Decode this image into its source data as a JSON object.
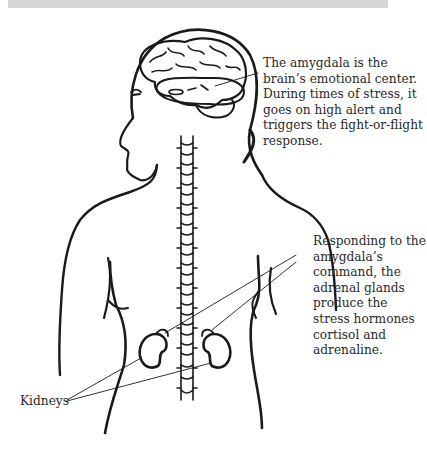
{
  "diagram": {
    "type": "anatomical-illustration",
    "annotations": {
      "amygdala": "The amygdala is the brain’s emotional center. During times of stress, it goes on high alert and triggers the fight-or-flight response.",
      "adrenal": "Responding to the amygdala’s command, the adrenal glands produce the stress hormones cortisol and adrenaline.",
      "kidneys": "Kidneys"
    },
    "colors": {
      "ink": "#1a1a1a",
      "text": "#2a2a2a",
      "background": "#ffffff",
      "top_band": "#d6d6d6"
    }
  }
}
